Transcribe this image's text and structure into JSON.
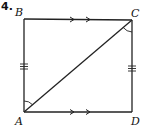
{
  "problem": {
    "number": "4.",
    "figure": {
      "shape": "quadrilateral",
      "vertices": {
        "A": "A",
        "B": "B",
        "C": "C",
        "D": "D"
      },
      "segments": [
        "AB",
        "BC",
        "CD",
        "DA",
        "AC"
      ],
      "markings": {
        "parallel_arrows": [
          "BC",
          "AD"
        ],
        "congruent_ticks_triple": [
          "AB",
          "CD"
        ],
        "congruent_angles": [
          "BAC",
          "ACD"
        ]
      }
    }
  }
}
